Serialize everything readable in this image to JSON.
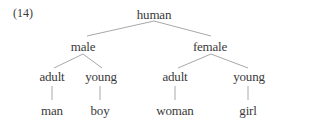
{
  "example_number": "(14)",
  "tree": {
    "root": "human",
    "level1": [
      "male",
      "female"
    ],
    "level2": {
      "male": [
        "adult",
        "young"
      ],
      "female": [
        "adult",
        "young"
      ]
    },
    "level3": {
      "male_adult": "man",
      "male_young": "boy",
      "female_adult": "woman",
      "female_young": "girl"
    }
  },
  "nodes": {
    "root": "human",
    "male": "male",
    "female": "female",
    "male_adult": "adult",
    "male_young": "young",
    "female_adult": "adult",
    "female_young": "young",
    "man": "man",
    "boy": "boy",
    "woman": "woman",
    "girl": "girl"
  },
  "colors": {
    "text": "#3a3a3a",
    "edges": "#a8a8a8",
    "background": "#ffffff"
  }
}
